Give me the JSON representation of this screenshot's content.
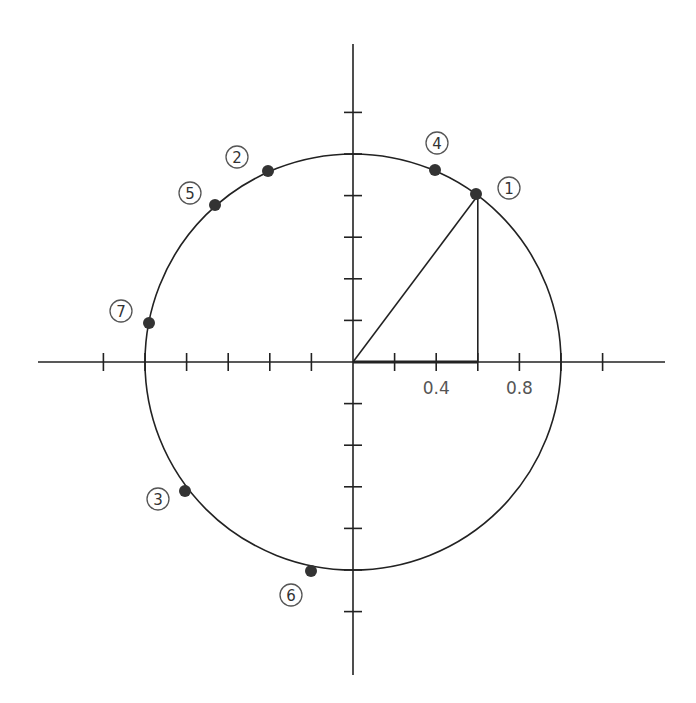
{
  "diagram": {
    "type": "unit-circle",
    "origin_px": [
      353,
      362
    ],
    "unit_px": 208,
    "tick_step": 0.2,
    "colors": {
      "line": "#222222",
      "point": "#333333",
      "label": "#555555",
      "background": "#ffffff"
    },
    "axes": {
      "x": {
        "min": -1.5,
        "max": 1.5,
        "ticks": [
          -1.2,
          -1.0,
          -0.8,
          -0.6,
          -0.4,
          -0.2,
          0.2,
          0.4,
          0.6,
          0.8,
          1.0,
          1.2
        ]
      },
      "y": {
        "min": -1.5,
        "max": 1.5,
        "ticks": [
          -1.2,
          -1.0,
          -0.8,
          -0.6,
          -0.4,
          -0.2,
          0.2,
          0.4,
          0.6,
          0.8,
          1.0,
          1.2
        ]
      }
    },
    "tick_labels": [
      {
        "text": "0.4",
        "x": 0.4
      },
      {
        "text": "0.8",
        "x": 0.8
      }
    ],
    "circle": {
      "radius": 1.0
    },
    "triangle": {
      "vertex": [
        0.6,
        0.8
      ],
      "description": "right triangle from origin to point 1 with vertical drop to x-axis"
    },
    "points": [
      {
        "id": "1",
        "label": "①",
        "px": [
          476,
          194
        ],
        "label_px": [
          509,
          188
        ]
      },
      {
        "id": "2",
        "label": "②",
        "px": [
          268,
          171
        ],
        "label_px": [
          237,
          157
        ]
      },
      {
        "id": "3",
        "label": "③",
        "px": [
          185,
          491
        ],
        "label_px": [
          158,
          499
        ]
      },
      {
        "id": "4",
        "label": "④",
        "px": [
          435,
          170
        ],
        "label_px": [
          437,
          143
        ]
      },
      {
        "id": "5",
        "label": "⑤",
        "px": [
          215,
          205
        ],
        "label_px": [
          190,
          193
        ]
      },
      {
        "id": "6",
        "label": "⑥",
        "px": [
          311,
          571
        ],
        "label_px": [
          291,
          595
        ]
      },
      {
        "id": "7",
        "label": "⑦",
        "px": [
          149,
          323
        ],
        "label_px": [
          121,
          311
        ]
      }
    ]
  }
}
